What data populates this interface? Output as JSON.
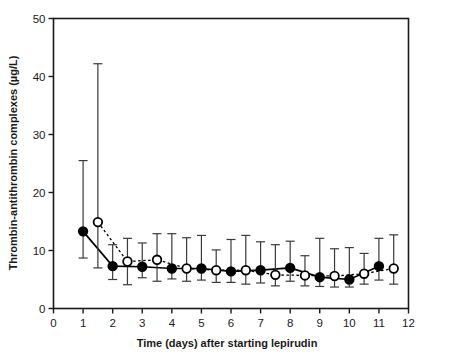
{
  "chart_data": {
    "type": "line",
    "title": "",
    "subtitle": "",
    "xlabel": "Time (days) after starting lepirudin",
    "ylabel": "Thrombin-antithrombin complexes (µg/L)",
    "xlim": [
      0,
      12
    ],
    "ylim": [
      0,
      50
    ],
    "xticks": [
      0,
      1,
      2,
      3,
      4,
      5,
      6,
      7,
      8,
      9,
      10,
      11,
      12
    ],
    "xtick_labels": [
      "0",
      "1",
      "2",
      "3",
      "4",
      "5",
      "6",
      "7",
      "8",
      "9",
      "10",
      "11",
      "12"
    ],
    "yticks": [
      0,
      10,
      20,
      30,
      40,
      50
    ],
    "ytick_labels": [
      "0",
      "10",
      "20",
      "30",
      "40",
      "50"
    ],
    "grid": false,
    "legend_position": "none",
    "error_bars": "whisker",
    "series": [
      {
        "name": "filled-circle-series",
        "marker": "filled-circle",
        "line_style": "solid",
        "color": "#000000",
        "points": [
          {
            "x": 1,
            "y": 13.3,
            "low": 8.7,
            "high": 25.5
          },
          {
            "x": 2,
            "y": 7.3,
            "low": 5.0,
            "high": 11.0
          },
          {
            "x": 3,
            "y": 7.2,
            "low": 5.3,
            "high": 11.3
          },
          {
            "x": 4,
            "y": 6.9,
            "low": 5.1,
            "high": 12.9
          },
          {
            "x": 5,
            "y": 6.9,
            "low": 4.9,
            "high": 12.6
          },
          {
            "x": 6,
            "y": 6.4,
            "low": 4.5,
            "high": 11.9
          },
          {
            "x": 7,
            "y": 6.6,
            "low": 4.4,
            "high": 11.5
          },
          {
            "x": 8,
            "y": 7.0,
            "low": 4.7,
            "high": 11.6
          },
          {
            "x": 9,
            "y": 5.4,
            "low": 3.8,
            "high": 12.1
          },
          {
            "x": 10,
            "y": 5.0,
            "low": 3.7,
            "high": 10.5
          },
          {
            "x": 11,
            "y": 7.3,
            "low": 4.9,
            "high": 12.1
          }
        ]
      },
      {
        "name": "open-circle-series",
        "marker": "open-circle",
        "line_style": "dotted",
        "color": "#000000",
        "points": [
          {
            "x": 1.5,
            "y": 14.9,
            "low": 7.0,
            "high": 42.2
          },
          {
            "x": 2.5,
            "y": 8.1,
            "low": 4.1,
            "high": 12.1
          },
          {
            "x": 3.5,
            "y": 8.4,
            "low": 4.7,
            "high": 12.9
          },
          {
            "x": 4.5,
            "y": 6.9,
            "low": 4.7,
            "high": 12.2
          },
          {
            "x": 5.5,
            "y": 6.6,
            "low": 4.5,
            "high": 10.1
          },
          {
            "x": 6.5,
            "y": 6.6,
            "low": 4.2,
            "high": 12.6
          },
          {
            "x": 7.5,
            "y": 5.8,
            "low": 3.9,
            "high": 11.0
          },
          {
            "x": 8.5,
            "y": 5.7,
            "low": 3.9,
            "high": 9.1
          },
          {
            "x": 9.5,
            "y": 5.6,
            "low": 3.7,
            "high": 10.3
          },
          {
            "x": 10.5,
            "y": 6.0,
            "low": 4.2,
            "high": 9.5
          },
          {
            "x": 11.5,
            "y": 6.9,
            "low": 4.2,
            "high": 12.7
          }
        ]
      }
    ]
  }
}
